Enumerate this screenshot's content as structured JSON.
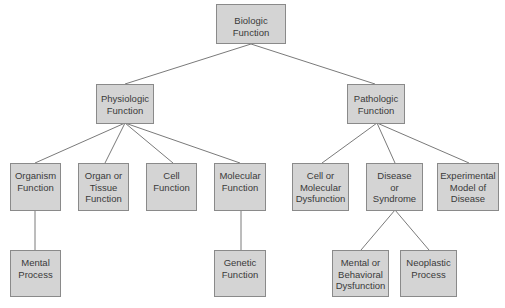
{
  "diagram": {
    "type": "hierarchy-tree",
    "colors": {
      "node_fill": "#d4d4d4",
      "node_border": "#8a8a8a",
      "edge": "#7a7a7a",
      "text": "#3a3a3a"
    },
    "nodes": {
      "biologic": {
        "label": "Biologic\nFunction"
      },
      "physiologic": {
        "label": "Physiologic\nFunction"
      },
      "pathologic": {
        "label": "Pathologic\nFunction"
      },
      "organism": {
        "label": "Organism\nFunction"
      },
      "organ_tissue": {
        "label": "Organ or\nTissue\nFunction"
      },
      "cell": {
        "label": "Cell\nFunction"
      },
      "molecular": {
        "label": "Molecular\nFunction"
      },
      "cell_mol_dys": {
        "label": "Cell or\nMolecular\nDysfunction"
      },
      "disease": {
        "label": "Disease\nor\nSyndrome"
      },
      "experimental": {
        "label": "Experimental\nModel of\nDisease"
      },
      "mental_process": {
        "label": "Mental\nProcess"
      },
      "genetic": {
        "label": "Genetic\nFunction"
      },
      "mental_behavioral": {
        "label": "Mental or\nBehavioral\nDysfunction"
      },
      "neoplastic": {
        "label": "Neoplastic\nProcess"
      }
    },
    "edges": [
      [
        "biologic",
        "physiologic"
      ],
      [
        "biologic",
        "pathologic"
      ],
      [
        "physiologic",
        "organism"
      ],
      [
        "physiologic",
        "organ_tissue"
      ],
      [
        "physiologic",
        "cell"
      ],
      [
        "physiologic",
        "molecular"
      ],
      [
        "pathologic",
        "cell_mol_dys"
      ],
      [
        "pathologic",
        "disease"
      ],
      [
        "pathologic",
        "experimental"
      ],
      [
        "organism",
        "mental_process"
      ],
      [
        "molecular",
        "genetic"
      ],
      [
        "disease",
        "mental_behavioral"
      ],
      [
        "disease",
        "neoplastic"
      ]
    ]
  }
}
